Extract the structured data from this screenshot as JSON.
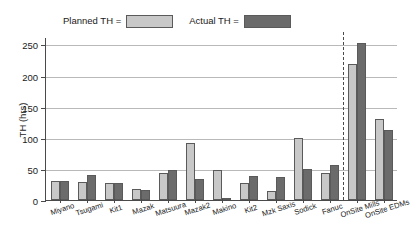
{
  "chart_data": {
    "type": "bar",
    "title": "",
    "xlabel": "",
    "ylabel": "TH (hrs)",
    "ylim": [
      0,
      262
    ],
    "yticks": [
      0,
      50,
      100,
      150,
      200,
      250
    ],
    "grid": true,
    "legend_position": "top",
    "categories": [
      "Miyano",
      "Tsugami",
      "Kit1",
      "Mazak",
      "Matsuura",
      "Mazak2",
      "Makino",
      "Kit2",
      "Mzk Saxis",
      "Sodick",
      "Fanuc",
      "OnSite Mills",
      "OnSite EDMs"
    ],
    "series": [
      {
        "name": "Planned TH",
        "color": "#c8c8c8",
        "values": [
          30,
          29,
          28,
          18,
          43,
          92,
          48,
          27,
          15,
          100,
          44,
          218,
          130
        ]
      },
      {
        "name": "Actual TH",
        "color": "#6b6b6b",
        "values": [
          30,
          40,
          28,
          16,
          48,
          33,
          4,
          39,
          37,
          50,
          57,
          252,
          112
        ]
      }
    ],
    "annotations": [
      {
        "type": "vertical-dashed-line",
        "after_category": "Fanuc"
      }
    ]
  },
  "legend": {
    "entries": [
      {
        "label": "Planned TH =",
        "swatch": "planned-swatch"
      },
      {
        "label": "Actual TH =",
        "swatch": "actual-swatch"
      }
    ]
  },
  "axis": {
    "y_title": "TH (hrs)",
    "y_tick_labels": [
      "250",
      "200",
      "150",
      "100",
      "50",
      "0"
    ]
  }
}
